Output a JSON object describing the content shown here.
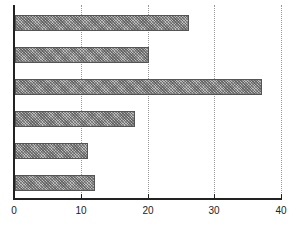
{
  "chart_data": {
    "type": "bar",
    "orientation": "horizontal",
    "title": "",
    "xlabel": "",
    "ylabel": "",
    "categories": [
      "",
      "",
      "",
      "",
      "",
      ""
    ],
    "values": [
      26,
      20,
      37,
      18,
      11,
      12
    ],
    "xlim": [
      0,
      40
    ],
    "x_ticks": [
      0,
      10,
      20,
      30,
      40
    ],
    "grid": "vertical dotted",
    "legend": "none",
    "bar_fill": "gray crosshatch pattern"
  },
  "axis": {
    "tick_labels": [
      "0",
      "10",
      "20",
      "30",
      "40"
    ]
  }
}
